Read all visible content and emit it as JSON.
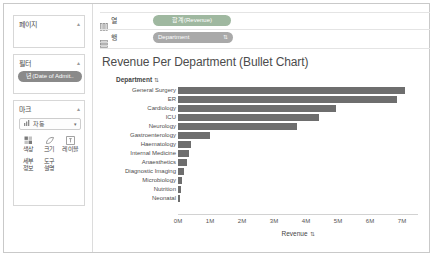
{
  "sidebar": {
    "pages": {
      "title": "페이지",
      "caret": "▴"
    },
    "filters": {
      "title": "필터",
      "caret": "▴",
      "pills": [
        {
          "label": "년(Date of Admit.."
        }
      ]
    },
    "marks": {
      "title": "마크",
      "caret": "▴",
      "type_dropdown": {
        "icon": "bar-chart-icon",
        "value": "자동",
        "caret": "▾"
      },
      "buttons": [
        {
          "name": "color",
          "label": "색상",
          "icon": "color-swatch-icon"
        },
        {
          "name": "size",
          "label": "크기",
          "icon": "size-icon"
        },
        {
          "name": "label",
          "label": "레이블",
          "icon": "label-icon"
        },
        {
          "name": "detail",
          "label": "세부\n정보",
          "label_line1": "세부",
          "label_line2": "정보",
          "icon": "detail-icon"
        },
        {
          "name": "tooltip",
          "label": "도구\n설명",
          "label_line1": "도구",
          "label_line2": "설명",
          "icon": "tooltip-icon"
        }
      ]
    }
  },
  "shelves": {
    "columns": {
      "name": "열",
      "icon": "columns-icon",
      "pill": {
        "label": "합계(Revenue)",
        "color": "#9fb8a0"
      }
    },
    "rows": {
      "name": "행",
      "icon": "rows-icon",
      "pill": {
        "label": "Department",
        "color": "#a9a9a9",
        "sort_icon": "⇅"
      }
    }
  },
  "chart_data": {
    "type": "bar",
    "title": "Revenue Per Department (Bullet Chart)",
    "xlabel": "Revenue",
    "ylabel": "Department",
    "row_header": "Department",
    "row_header_sort": "⇅",
    "xlabel_sort": "⇅",
    "grid": false,
    "legend": "none",
    "orientation": "horizontal",
    "xlim": [
      0,
      7.5
    ],
    "tick_labels": [
      "0M",
      "1M",
      "2M",
      "3M",
      "4M",
      "5M",
      "6M",
      "7M"
    ],
    "tick_values": [
      0,
      1,
      2,
      3,
      4,
      5,
      6,
      7
    ],
    "bar_color": "#6e6e6e",
    "categories": [
      "General Surgery",
      "ER",
      "Cardiology",
      "ICU",
      "Neurology",
      "Gastroenterology",
      "Haematology",
      "Internal Medicine",
      "Anaesthetics",
      "Diagnostic Imaging",
      "Microbiology",
      "Nutrition",
      "Neonatal"
    ],
    "values": [
      7.1,
      6.85,
      4.95,
      4.4,
      3.72,
      1.0,
      0.42,
      0.33,
      0.28,
      0.18,
      0.13,
      0.09,
      0.05
    ],
    "units": "M"
  }
}
